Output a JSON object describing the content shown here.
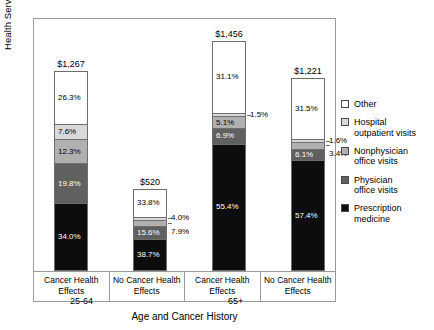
{
  "chart_data": {
    "type": "bar",
    "title": "",
    "xlabel": "Age and Cancer History",
    "ylabel": "Health Services Expenditures ($)",
    "grid": false,
    "legend_position": "right",
    "stacked": true,
    "ylim": [
      0,
      1456
    ],
    "categories": [
      "Cancer Health Effects",
      "No Cancer Health Effects",
      "Cancer Health Effects",
      "No Cancer Health Effects"
    ],
    "groups": [
      {
        "label": "25-64",
        "categories": [
          0,
          1
        ]
      },
      {
        "label": "65+",
        "categories": [
          2,
          3
        ]
      }
    ],
    "totals": [
      "$1,267",
      "$520",
      "$1,456",
      "$1,221"
    ],
    "totals_numeric": [
      1267,
      520,
      1456,
      1221
    ],
    "series": [
      {
        "name": "Other",
        "color": "#ffffff",
        "values": [
          26.3,
          33.8,
          31.1,
          31.5
        ],
        "labels": [
          "26.3%",
          "33.8%",
          "31.1%",
          "31.5%"
        ]
      },
      {
        "name": "Hospital outpatient visits",
        "color": "#d9d9d9",
        "values": [
          7.6,
          4.0,
          1.5,
          1.6
        ],
        "labels": [
          "7.6%",
          "4.0%",
          "1.5%",
          "1.6%"
        ]
      },
      {
        "name": "Nonphysician office visits",
        "color": "#b0b0b0",
        "values": [
          12.3,
          7.9,
          5.1,
          3.4
        ],
        "labels": [
          "12.3%",
          "7.9%",
          "5.1%",
          "3.4%"
        ]
      },
      {
        "name": "Physician office visits",
        "color": "#606060",
        "values": [
          19.8,
          15.6,
          6.9,
          6.1
        ],
        "labels": [
          "19.8%",
          "15.6%",
          "6.9%",
          "6.1%"
        ]
      },
      {
        "name": "Prescription medicine",
        "color": "#0d0d0d",
        "values": [
          34.0,
          38.7,
          55.4,
          57.4
        ],
        "labels": [
          "34.0%",
          "38.7%",
          "55.4%",
          "57.4%"
        ]
      }
    ]
  },
  "legend": {
    "items": [
      {
        "label": "Other",
        "color": "#ffffff"
      },
      {
        "label": "Hospital\noutpatient visits",
        "color": "#d9d9d9"
      },
      {
        "label": "Nonphysician\noffice visits",
        "color": "#b0b0b0"
      },
      {
        "label": "Physician\noffice visits",
        "color": "#606060"
      },
      {
        "label": "Prescription\nmedicine",
        "color": "#0d0d0d"
      }
    ]
  }
}
